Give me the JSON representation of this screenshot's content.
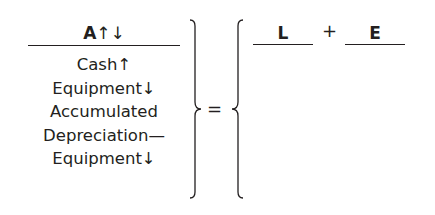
{
  "assets": {
    "header": "A",
    "header_arrows": "↑↓",
    "items": [
      "Cash↑",
      "Equipment↓",
      "Accumulated",
      "Depreciation—",
      "Equipment↓"
    ]
  },
  "equals": "=",
  "liabilities": {
    "label": "L"
  },
  "plus": "+",
  "equity": {
    "label": "E"
  }
}
